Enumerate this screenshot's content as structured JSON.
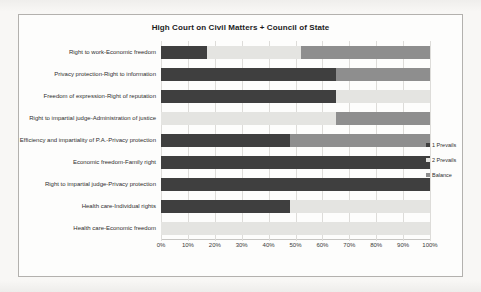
{
  "title": "High Court on Civil Matters + Council of State",
  "colors": {
    "series1": "#3f3f3f",
    "series2": "#e4e4e1",
    "series3": "#8e8e8e",
    "gridline": "#dddcd9",
    "box_border": "#b3b1ae"
  },
  "chart_data": {
    "type": "bar",
    "orientation": "horizontal",
    "stacked": true,
    "title": "High Court on Civil Matters + Council of State",
    "categories": [
      "Right to work-Economic freedom",
      "Privacy protection-Right to information",
      "Freedom of expression-Right of reputation",
      "Right to impartial judge-Administration of justice",
      "Efficiency and impartiality of P.A.-Privacy protection",
      "Economic freedom-Family right",
      "Right to impartial judge-Privacy protection",
      "Health care-Individual rights",
      "Health care-Economic freedom"
    ],
    "series": [
      {
        "name": "1 Prevails",
        "color": "#3f3f3f",
        "values": [
          17,
          65,
          65,
          0,
          48,
          100,
          100,
          48,
          0
        ]
      },
      {
        "name": "2 Prevails",
        "color": "#e4e4e1",
        "values": [
          35,
          0,
          35,
          65,
          0,
          0,
          0,
          52,
          100
        ]
      },
      {
        "name": "Balance",
        "color": "#8e8e8e",
        "values": [
          48,
          35,
          0,
          35,
          52,
          0,
          0,
          0,
          0
        ]
      }
    ],
    "xlabel": "",
    "ylabel": "",
    "xlim": [
      0,
      100
    ],
    "x_tick_labels": [
      "0%",
      "10%",
      "20%",
      "30%",
      "40%",
      "50%",
      "60%",
      "70%",
      "80%",
      "90%",
      "100%"
    ],
    "grid": true,
    "legend_position": "right"
  }
}
